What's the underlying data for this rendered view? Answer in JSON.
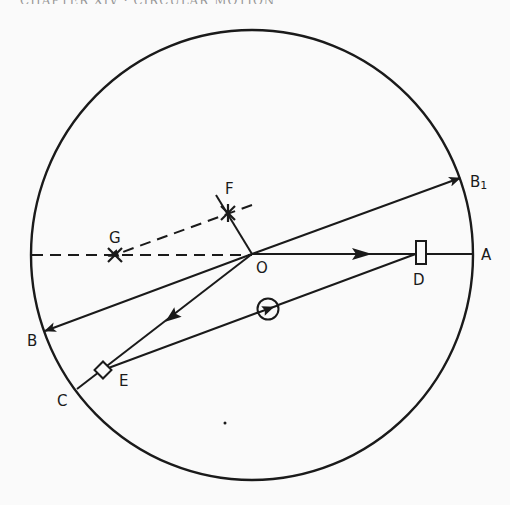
{
  "header": {
    "cut_off_text": "CHAPTER XIV · CIRCULAR MOTION"
  },
  "diagram": {
    "circle": {
      "cx": 252,
      "cy": 255,
      "rx": 221,
      "ry": 225
    },
    "colors": {
      "stroke": "#1a1a1a",
      "background": "#fafafa"
    },
    "points": {
      "O": {
        "label": "O",
        "x": 252,
        "y": 254
      },
      "A": {
        "label": "A",
        "x": 473,
        "y": 254
      },
      "B": {
        "label": "B",
        "x": 45,
        "y": 331
      },
      "B1": {
        "label": "B",
        "subscript": "1",
        "x": 460,
        "y": 178
      },
      "C": {
        "label": "C",
        "x": 77,
        "y": 389
      },
      "D": {
        "label": "D",
        "x": 421,
        "y": 252
      },
      "E": {
        "label": "E",
        "x": 103,
        "y": 370
      },
      "F": {
        "label": "F",
        "x": 228,
        "y": 213
      },
      "G": {
        "label": "G",
        "x": 115,
        "y": 255
      }
    },
    "lines": [
      {
        "name": "OA",
        "from": "O",
        "to": "A",
        "style": "solid",
        "arrow": "mid"
      },
      {
        "name": "OB1",
        "from": "O",
        "to": "B1",
        "style": "solid",
        "arrow": "end"
      },
      {
        "name": "OB",
        "from": "O",
        "to": "B",
        "style": "solid",
        "arrow": "end"
      },
      {
        "name": "OE",
        "from": "O",
        "to": "E",
        "style": "solid",
        "arrow": "mid"
      },
      {
        "name": "EC",
        "from": "E",
        "to": "C",
        "style": "solid",
        "arrow": "none"
      },
      {
        "name": "ED",
        "from": "E",
        "to": "D",
        "style": "solid",
        "arrow": "circled-mid"
      },
      {
        "name": "OF",
        "from": "O",
        "to": "F",
        "style": "solid",
        "arrow": "none"
      },
      {
        "name": "OG",
        "from": "O",
        "to": "G",
        "style": "dashed",
        "arrow": "none"
      },
      {
        "name": "FG",
        "from": "F",
        "to": "G",
        "style": "dashed",
        "arrow": "end"
      }
    ],
    "markers": {
      "D": "rectangle",
      "E": "rotated-square",
      "F": "star",
      "G": "star",
      "dot": {
        "x": 225,
        "y": 423
      }
    }
  }
}
